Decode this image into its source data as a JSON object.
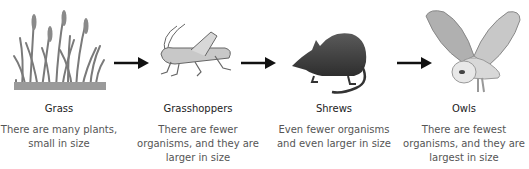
{
  "diagram": {
    "type": "food-chain",
    "colors": {
      "arrow": "#111111",
      "illustration": "#7a7a7a",
      "shrew": "#4a4a4a",
      "label": "#222222",
      "description": "#555555"
    },
    "stages": [
      {
        "name": "Grass",
        "icon": "grass-icon",
        "description_lines": [
          "There are many plants,",
          "small in size"
        ]
      },
      {
        "name": "Grasshoppers",
        "icon": "grasshopper-icon",
        "description_lines": [
          "There are fewer",
          "organisms, and they are",
          "larger in size"
        ]
      },
      {
        "name": "Shrews",
        "icon": "shrew-icon",
        "description_lines": [
          "Even fewer organisms",
          "and even larger in size"
        ]
      },
      {
        "name": "Owls",
        "icon": "owl-icon",
        "description_lines": [
          "There are fewest",
          "organisms, and they are",
          "largest in size"
        ]
      }
    ],
    "arrows": [
      {
        "from": "Grass",
        "to": "Grasshoppers"
      },
      {
        "from": "Grasshoppers",
        "to": "Shrews"
      },
      {
        "from": "Shrews",
        "to": "Owls"
      }
    ]
  }
}
